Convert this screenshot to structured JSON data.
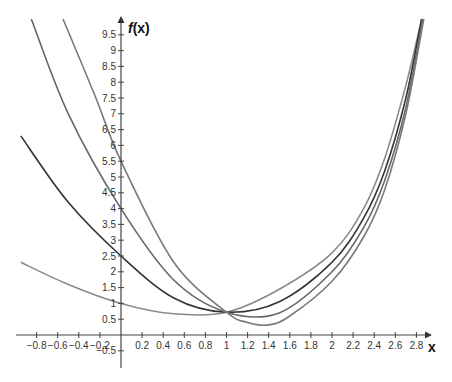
{
  "chart_data": {
    "type": "line",
    "title": "",
    "xlabel": "x",
    "ylabel": "f(x)",
    "xlim": [
      -0.95,
      2.85
    ],
    "ylim": [
      -0.8,
      10.0
    ],
    "grid": false,
    "legend": null,
    "x_ticks": [
      "-0.8",
      "-0.6",
      "-0.4",
      "-0.2",
      "0.2",
      "0.4",
      "0.6",
      "0.8",
      "1",
      "1.2",
      "1.4",
      "1.6",
      "1.8",
      "2",
      "2.2",
      "2.4",
      "2.6",
      "2.8"
    ],
    "y_ticks": [
      "-0.5",
      "0.5",
      "1",
      "1.5",
      "2",
      "2.5",
      "3",
      "3.5",
      "4",
      "4.5",
      "5",
      "5.5",
      "6",
      "6.5",
      "7",
      "7.5",
      "8",
      "8.5",
      "9",
      "9.5"
    ],
    "annotations": [
      "All curves intersect near (1, 0.72)"
    ],
    "series": [
      {
        "name": "curve-1",
        "color": "#8a8a8a",
        "points": [
          [
            -0.95,
            2.3
          ],
          [
            -0.5,
            1.6
          ],
          [
            0,
            1.0
          ],
          [
            0.5,
            0.67
          ],
          [
            1,
            0.72
          ],
          [
            1.5,
            1.45
          ],
          [
            2,
            2.6
          ],
          [
            2.3,
            4.0
          ],
          [
            2.5,
            5.6
          ],
          [
            2.7,
            7.9
          ],
          [
            2.85,
            10.0
          ]
        ]
      },
      {
        "name": "curve-2",
        "color": "#333333",
        "points": [
          [
            -0.95,
            6.3
          ],
          [
            -0.5,
            4.2
          ],
          [
            0,
            2.5
          ],
          [
            0.5,
            1.17
          ],
          [
            1,
            0.72
          ],
          [
            1.5,
            1.05
          ],
          [
            2,
            2.3
          ],
          [
            2.3,
            3.7
          ],
          [
            2.5,
            5.2
          ],
          [
            2.7,
            7.5
          ],
          [
            2.85,
            10.0
          ]
        ]
      },
      {
        "name": "curve-3",
        "color": "#666666",
        "points": [
          [
            -0.85,
            10.0
          ],
          [
            -0.5,
            7.0
          ],
          [
            0,
            4.0
          ],
          [
            0.5,
            1.74
          ],
          [
            1,
            0.72
          ],
          [
            1.5,
            0.7
          ],
          [
            2,
            2.0
          ],
          [
            2.3,
            3.4
          ],
          [
            2.5,
            4.9
          ],
          [
            2.7,
            7.2
          ],
          [
            2.86,
            10.0
          ]
        ]
      },
      {
        "name": "curve-4",
        "color": "#7a7a7a",
        "points": [
          [
            -0.55,
            10.0
          ],
          [
            -0.25,
            7.6
          ],
          [
            0,
            5.5
          ],
          [
            0.5,
            2.3
          ],
          [
            1,
            0.72
          ],
          [
            1.2,
            0.4
          ],
          [
            1.4,
            0.32
          ],
          [
            1.6,
            0.6
          ],
          [
            2,
            1.7
          ],
          [
            2.3,
            3.1
          ],
          [
            2.5,
            4.6
          ],
          [
            2.7,
            7.0
          ],
          [
            2.87,
            10.0
          ]
        ]
      }
    ]
  }
}
